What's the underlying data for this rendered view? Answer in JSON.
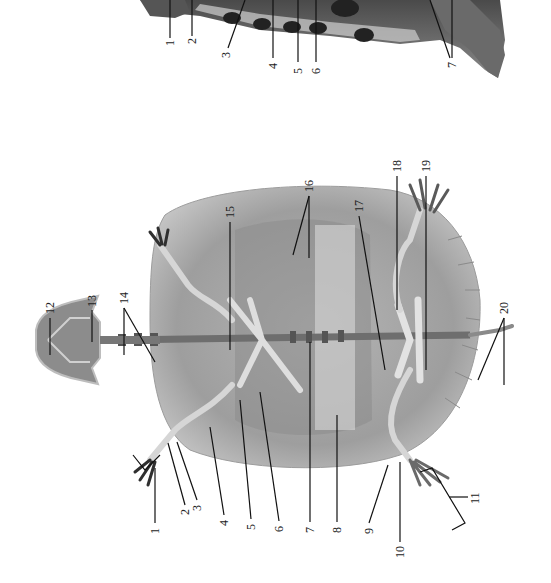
{
  "figure": {
    "colors": {
      "background": "#ffffff",
      "shell_light": "#c9c9c9",
      "shell_mid": "#9a9a9a",
      "shell_dark": "#3a3a3a",
      "bone": "#dcdcdc",
      "leader_line": "#111111",
      "label_text": "#222222"
    }
  },
  "top_specimen": {
    "view": "lateral (partial, cropped at top edge)",
    "labels": [
      {
        "n": "1",
        "x": 170,
        "y": 46
      },
      {
        "n": "2",
        "x": 192,
        "y": 44
      },
      {
        "n": "3",
        "x": 226,
        "y": 56
      },
      {
        "n": "4",
        "x": 273,
        "y": 66
      },
      {
        "n": "5",
        "x": 298,
        "y": 71
      },
      {
        "n": "6",
        "x": 316,
        "y": 71
      },
      {
        "n": "7",
        "x": 452,
        "y": 65
      }
    ]
  },
  "bottom_specimen": {
    "view": "ventral skeleton",
    "labels": [
      {
        "n": "1",
        "x": 155,
        "y": 533
      },
      {
        "n": "2",
        "x": 185,
        "y": 514
      },
      {
        "n": "3",
        "x": 197,
        "y": 510
      },
      {
        "n": "4",
        "x": 224,
        "y": 525
      },
      {
        "n": "5",
        "x": 251,
        "y": 529
      },
      {
        "n": "6",
        "x": 279,
        "y": 531
      },
      {
        "n": "7",
        "x": 310,
        "y": 532
      },
      {
        "n": "8",
        "x": 337,
        "y": 532
      },
      {
        "n": "9",
        "x": 369,
        "y": 533
      },
      {
        "n": "10",
        "x": 400,
        "y": 552
      },
      {
        "n": "11",
        "x": 475,
        "y": 497
      },
      {
        "n": "12",
        "x": 50,
        "y": 307
      },
      {
        "n": "13",
        "x": 92,
        "y": 300
      },
      {
        "n": "14",
        "x": 124,
        "y": 295
      },
      {
        "n": "15",
        "x": 230,
        "y": 210
      },
      {
        "n": "16",
        "x": 309,
        "y": 184
      },
      {
        "n": "17",
        "x": 359,
        "y": 204
      },
      {
        "n": "18",
        "x": 397,
        "y": 164
      },
      {
        "n": "19",
        "x": 426,
        "y": 164
      },
      {
        "n": "20",
        "x": 504,
        "y": 306
      }
    ]
  }
}
